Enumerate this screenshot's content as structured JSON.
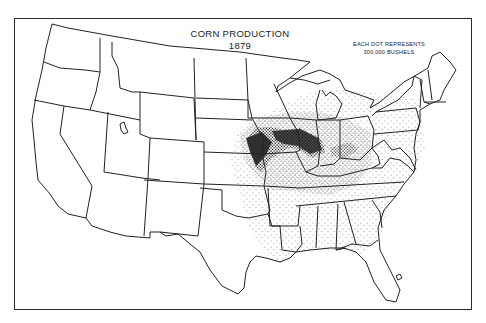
{
  "map": {
    "title": "CORN PRODUCTION",
    "year": "1879",
    "legend": {
      "line1": "EACH DOT REPRESENTS",
      "line2": "300,000 BUSHELS"
    },
    "style": {
      "ink": "#222222",
      "background": "#ffffff",
      "dot_color": "#1a1a1a"
    },
    "region": "United States (conterminous)",
    "concentration_areas": [
      "Iowa",
      "Illinois",
      "Missouri",
      "Indiana",
      "Ohio",
      "eastern Nebraska",
      "eastern Kansas",
      "Kentucky",
      "Tennessee"
    ]
  }
}
